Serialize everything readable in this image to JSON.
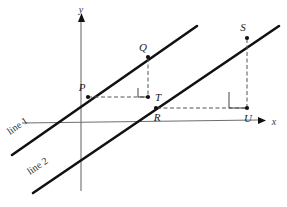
{
  "figure": {
    "type": "geometry-diagram",
    "axes": {
      "x_label": "x",
      "y_label": "y",
      "x_axis_name": "x-axis",
      "y_axis_name": "y-axis"
    },
    "lines": [
      {
        "id": "line1",
        "label": "line 1"
      },
      {
        "id": "line2",
        "label": "line 2"
      }
    ],
    "points": [
      {
        "id": "P",
        "label": "P",
        "x": 88,
        "y": 97
      },
      {
        "id": "Q",
        "label": "Q",
        "x": 148,
        "y": 57
      },
      {
        "id": "T",
        "label": "T",
        "x": 148,
        "y": 97
      },
      {
        "id": "R",
        "label": "R",
        "x": 156,
        "y": 108
      },
      {
        "id": "S",
        "label": "S",
        "x": 247,
        "y": 38
      },
      {
        "id": "U",
        "label": "U",
        "x": 247,
        "y": 108
      }
    ],
    "right_angles": [
      {
        "at": "T",
        "vertices": "P-T-Q"
      },
      {
        "at": "U",
        "vertices": "R-U-S"
      }
    ],
    "colors": {
      "stroke_thick": "#111111",
      "axis": "#6e6e6e",
      "dashed": "#555555",
      "background": "#ffffff",
      "label": "#1a1a1a"
    }
  }
}
